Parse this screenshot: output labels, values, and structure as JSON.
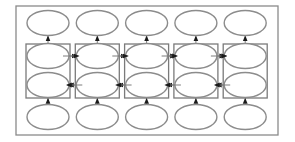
{
  "diagram": {
    "type": "bidirectional-rnn",
    "columns": 5,
    "rows": [
      {
        "name": "output",
        "role": "output-nodes"
      },
      {
        "name": "forward-hidden",
        "role": "hidden-nodes",
        "direction": "right"
      },
      {
        "name": "backward-hidden",
        "role": "hidden-nodes",
        "direction": "left"
      },
      {
        "name": "input",
        "role": "input-nodes"
      }
    ],
    "colors": {
      "node_stroke": "#8c8c8c",
      "box_stroke": "#7a7a7a",
      "arrow": "#1a1a1a",
      "background": "#ffffff"
    }
  }
}
